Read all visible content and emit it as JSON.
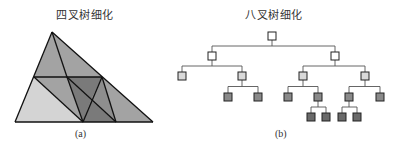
{
  "panel_a": {
    "title": "四叉树细化",
    "caption": "(a)",
    "colors": {
      "light": "#d4d4d4",
      "medium": "#a3a3a3",
      "dark": "#7a7a7a",
      "edge": "#111111"
    }
  },
  "panel_b": {
    "title": "八叉树细化",
    "caption": "(b)",
    "colors": {
      "level0": "#ffffff",
      "level1": "#ffffff",
      "level2": "#d9d9d9",
      "leaf": "#8a8a8a",
      "deep_leaf": "#6a6a6a",
      "line": "#555555"
    },
    "tree": {
      "id": "root",
      "level": 0,
      "children": [
        {
          "id": "L",
          "level": 1,
          "children": [
            {
              "id": "LL",
              "level": 2,
              "children": []
            },
            {
              "id": "LR",
              "level": 2,
              "children": [
                {
                  "id": "LRa",
                  "level": 3,
                  "children": []
                },
                {
                  "id": "LRb",
                  "level": 3,
                  "children": []
                }
              ]
            }
          ]
        },
        {
          "id": "R",
          "level": 1,
          "children": [
            {
              "id": "RL",
              "level": 2,
              "children": [
                {
                  "id": "RLa",
                  "level": 3,
                  "children": []
                },
                {
                  "id": "RLb",
                  "level": 3,
                  "children": [
                    {
                      "id": "RLb1",
                      "level": 4,
                      "children": []
                    },
                    {
                      "id": "RLb2",
                      "level": 4,
                      "children": []
                    }
                  ]
                }
              ]
            },
            {
              "id": "RR",
              "level": 2,
              "children": [
                {
                  "id": "RRa",
                  "level": 3,
                  "children": [
                    {
                      "id": "RRa1",
                      "level": 4,
                      "children": []
                    },
                    {
                      "id": "RRa2",
                      "level": 4,
                      "children": []
                    }
                  ]
                },
                {
                  "id": "RRb",
                  "level": 3,
                  "children": []
                }
              ]
            }
          ]
        }
      ]
    }
  }
}
